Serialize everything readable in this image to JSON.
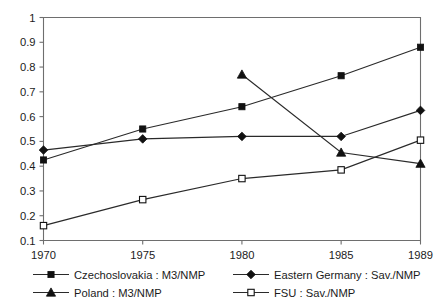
{
  "chart_data": {
    "type": "line",
    "title": "",
    "xlabel": "",
    "ylabel": "",
    "x": [
      1970,
      1975,
      1980,
      1985,
      1989
    ],
    "categories": [
      "1970",
      "1975",
      "1980",
      "1985",
      "1989"
    ],
    "xtick_labels": [
      "1970",
      "1975",
      "1980",
      "1985",
      "1989"
    ],
    "ytick_labels": [
      "0.1",
      "0.2",
      "0.3",
      "0.4",
      "0.5",
      "0.6",
      "0.7",
      "0.8",
      "0.9",
      "1"
    ],
    "ytick_values": [
      0.1,
      0.2,
      0.3,
      0.4,
      0.5,
      0.6,
      0.7,
      0.8,
      0.9,
      1.0
    ],
    "ylim": [
      0.1,
      1.0
    ],
    "xlim": [
      1970,
      1989
    ],
    "grid": false,
    "legend_position": "below",
    "series": [
      {
        "name": "Czechoslovakia : M3/NMP",
        "marker": "filled-square",
        "x": [
          1970,
          1975,
          1980,
          1985,
          1989
        ],
        "values": [
          0.425,
          0.55,
          0.64,
          0.765,
          0.88
        ]
      },
      {
        "name": "Eastern Germany : Sav./NMP",
        "marker": "filled-diamond",
        "x": [
          1970,
          1975,
          1980,
          1985,
          1989
        ],
        "values": [
          0.465,
          0.51,
          0.52,
          0.52,
          0.625
        ]
      },
      {
        "name": "Poland : M3/NMP",
        "marker": "filled-triangle",
        "x": [
          1980,
          1985,
          1989
        ],
        "values": [
          0.77,
          0.455,
          0.41
        ]
      },
      {
        "name": "FSU : Sav./NMP",
        "marker": "open-square",
        "x": [
          1970,
          1975,
          1980,
          1985,
          1989
        ],
        "values": [
          0.16,
          0.265,
          0.35,
          0.385,
          0.505
        ]
      }
    ]
  },
  "legend": {
    "entries": [
      {
        "label": "Czechoslovakia : M3/NMP",
        "marker": "filled-square"
      },
      {
        "label": "Eastern Germany : Sav./NMP",
        "marker": "filled-diamond"
      },
      {
        "label": "Poland : M3/NMP",
        "marker": "filled-triangle"
      },
      {
        "label": "FSU : Sav./NMP",
        "marker": "open-square"
      }
    ]
  },
  "colors": {
    "line": "#2a2a2a",
    "marker": "#111111",
    "axis": "#6e6e6e",
    "text": "#1b1b1b",
    "background": "#ffffff"
  }
}
